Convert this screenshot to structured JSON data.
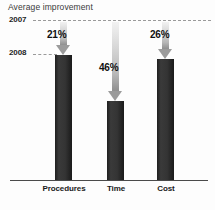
{
  "chart_data": {
    "type": "bar",
    "title": "Average improvement",
    "xlabel": "",
    "ylabel": "",
    "categories": [
      "Procedures",
      "Time",
      "Cost"
    ],
    "values": [
      79,
      54,
      74
    ],
    "data_labels": [
      "21%",
      "46%",
      "26%"
    ],
    "improvements_pct": [
      21,
      46,
      26
    ],
    "reference_lines": [
      {
        "label": "2007",
        "value": 100
      },
      {
        "label": "2008",
        "value": 79
      }
    ],
    "axis_labels": {
      "upper": "2007",
      "lower": "2008"
    },
    "grid": false,
    "legend": false,
    "ylim": [
      0,
      100
    ],
    "note": "Arrows show the drop from the 2007 level down to the 2008 bar top; label is the percent improvement.",
    "colors": {
      "bar": "#2e2e2e",
      "arrow": "#9b9b9b",
      "dash": "#9a9a9a",
      "axis": "#4a4a4a",
      "title_text": "#3a3a3a",
      "label_text": "#111111"
    }
  },
  "columns": [
    {
      "name": "procedures",
      "category": "Procedures",
      "percent": "21%",
      "left": 55,
      "bar_top": 55,
      "arrow_top": 22,
      "arrow_height": 33,
      "pct_left": 47,
      "pct_top": 29,
      "label_left": 33,
      "label_width": 62
    },
    {
      "name": "time",
      "category": "Time",
      "percent": "46%",
      "left": 107,
      "bar_top": 101,
      "arrow_top": 22,
      "arrow_height": 79,
      "pct_left": 99,
      "pct_top": 62,
      "label_left": 88,
      "label_width": 56
    },
    {
      "name": "cost",
      "category": "Cost",
      "percent": "26%",
      "left": 157,
      "bar_top": 59,
      "arrow_top": 22,
      "arrow_height": 37,
      "pct_left": 150,
      "pct_top": 29,
      "label_left": 138,
      "label_width": 56
    }
  ]
}
